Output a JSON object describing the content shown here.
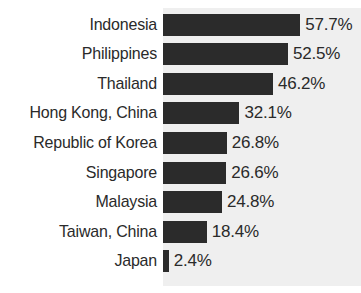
{
  "chart_data": {
    "type": "bar",
    "orientation": "horizontal",
    "title": "",
    "subtitle": "",
    "xlabel": "",
    "ylabel": "",
    "xlim": [
      0,
      60
    ],
    "grid": false,
    "legend": null,
    "value_suffix": "%",
    "categories": [
      "Indonesia",
      "Philippines",
      "Thailand",
      "Hong Kong, China",
      "Republic of Korea",
      "Singapore",
      "Malaysia",
      "Taiwan, China",
      "Japan"
    ],
    "values": [
      57.7,
      52.5,
      46.2,
      32.1,
      26.8,
      26.6,
      24.8,
      18.4,
      2.4
    ],
    "value_labels": [
      "57.7%",
      "52.5%",
      "46.2%",
      "32.1%",
      "26.8%",
      "26.6%",
      "24.8%",
      "18.4%",
      "2.4%"
    ],
    "colors": {
      "bar": "#2b2b2b",
      "panel": "#efefef",
      "background": "#ffffff",
      "text": "#2a2a2a"
    },
    "scale_px_per_unit": 2.38
  }
}
